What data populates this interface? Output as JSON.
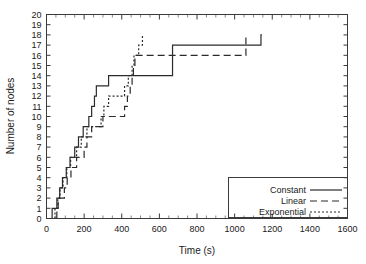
{
  "chart_data": {
    "type": "line",
    "title": "",
    "xlabel": "Time (s)",
    "ylabel": "Number of nodes",
    "xlim": [
      0,
      1600
    ],
    "ylim": [
      0,
      20
    ],
    "xticks": [
      0,
      200,
      400,
      600,
      800,
      1000,
      1200,
      1400,
      1600
    ],
    "yticks": [
      0,
      1,
      2,
      3,
      4,
      5,
      6,
      7,
      8,
      9,
      10,
      11,
      12,
      13,
      14,
      15,
      16,
      17,
      18,
      19,
      20
    ],
    "x_minor_tick_step": 50,
    "y_minor_tick_step": 1,
    "grid": false,
    "legend_position": "lower right",
    "line_color": "#2b2b2b",
    "step_type": "post",
    "series": [
      {
        "name": "Constant",
        "style": "solid",
        "points": [
          [
            30,
            1
          ],
          [
            55,
            2
          ],
          [
            70,
            3
          ],
          [
            85,
            4
          ],
          [
            105,
            5
          ],
          [
            125,
            6
          ],
          [
            150,
            7
          ],
          [
            170,
            8
          ],
          [
            195,
            9
          ],
          [
            225,
            10
          ],
          [
            240,
            11
          ],
          [
            255,
            12
          ],
          [
            265,
            13
          ],
          [
            330,
            14
          ],
          [
            670,
            17
          ],
          [
            1140,
            18
          ]
        ]
      },
      {
        "name": "Linear",
        "style": "dashed",
        "points": [
          [
            55,
            1
          ],
          [
            62,
            2
          ],
          [
            95,
            3
          ],
          [
            110,
            4
          ],
          [
            130,
            5
          ],
          [
            160,
            6
          ],
          [
            200,
            7
          ],
          [
            215,
            8
          ],
          [
            240,
            9
          ],
          [
            300,
            10
          ],
          [
            415,
            11
          ],
          [
            430,
            12
          ],
          [
            445,
            13
          ],
          [
            455,
            14
          ],
          [
            462,
            15
          ],
          [
            470,
            16
          ],
          [
            1060,
            18
          ]
        ]
      },
      {
        "name": "Exponential",
        "style": "dotted",
        "points": [
          [
            45,
            1
          ],
          [
            60,
            2
          ],
          [
            72,
            3
          ],
          [
            88,
            4
          ],
          [
            108,
            5
          ],
          [
            128,
            6
          ],
          [
            160,
            7
          ],
          [
            185,
            8
          ],
          [
            215,
            9
          ],
          [
            290,
            10
          ],
          [
            305,
            11
          ],
          [
            330,
            12
          ],
          [
            415,
            13
          ],
          [
            435,
            14
          ],
          [
            455,
            15
          ],
          [
            465,
            16
          ],
          [
            490,
            17
          ],
          [
            510,
            18
          ]
        ]
      }
    ]
  },
  "legend": {
    "entries": [
      {
        "label": "Constant",
        "style": "solid"
      },
      {
        "label": "Linear",
        "style": "dashed"
      },
      {
        "label": "Exponential",
        "style": "dotted"
      }
    ]
  },
  "axes": {
    "x_title": "Time (s)",
    "y_title": "Number of nodes",
    "x_tick_labels": [
      "0",
      "200",
      "400",
      "600",
      "800",
      "1000",
      "1200",
      "1400",
      "1600"
    ],
    "y_tick_labels": [
      "0",
      "1",
      "2",
      "3",
      "4",
      "5",
      "6",
      "7",
      "8",
      "9",
      "10",
      "11",
      "12",
      "13",
      "14",
      "15",
      "16",
      "17",
      "18",
      "19",
      "20"
    ]
  }
}
